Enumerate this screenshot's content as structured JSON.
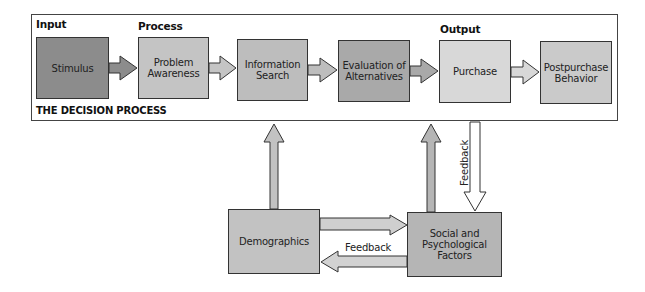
{
  "diagram": {
    "frame_title": "THE DECISION PROCESS",
    "section_labels": {
      "input": "Input",
      "process": "Process",
      "output": "Output"
    },
    "stages": [
      {
        "id": "stimulus",
        "label": "Stimulus",
        "fill": "#8c8c8c"
      },
      {
        "id": "problem-awareness",
        "label": "Problem\nAwareness",
        "fill": "#c4c4c4"
      },
      {
        "id": "information-search",
        "label": "Information\nSearch",
        "fill": "#bdbdbd"
      },
      {
        "id": "evaluation-of-alternatives",
        "label": "Evaluation of\nAlternatives",
        "fill": "#a9a9a9"
      },
      {
        "id": "purchase",
        "label": "Purchase",
        "fill": "#d8d8d8"
      },
      {
        "id": "postpurchase-behavior",
        "label": "Postpurchase\nBehavior",
        "fill": "#cacaca"
      }
    ],
    "influences": [
      {
        "id": "demographics",
        "label": "Demographics",
        "fill": "#c2c2c2"
      },
      {
        "id": "social-psychological",
        "label": "Social and\nPsychological\nFactors",
        "fill": "#b5b5b5"
      }
    ],
    "feedback_labels": {
      "purchase_to_social": "Feedback",
      "social_to_demographics": "Feedback"
    },
    "edges": [
      {
        "from": "stimulus",
        "to": "problem-awareness"
      },
      {
        "from": "problem-awareness",
        "to": "information-search"
      },
      {
        "from": "information-search",
        "to": "evaluation-of-alternatives"
      },
      {
        "from": "evaluation-of-alternatives",
        "to": "purchase"
      },
      {
        "from": "purchase",
        "to": "postpurchase-behavior"
      },
      {
        "from": "demographics",
        "to": "information-search"
      },
      {
        "from": "social-psychological",
        "to": "evaluation-of-alternatives"
      },
      {
        "from": "purchase",
        "to": "social-psychological",
        "label": "Feedback"
      },
      {
        "from": "demographics",
        "to": "social-psychological"
      },
      {
        "from": "social-psychological",
        "to": "demographics",
        "label": "Feedback"
      }
    ]
  }
}
